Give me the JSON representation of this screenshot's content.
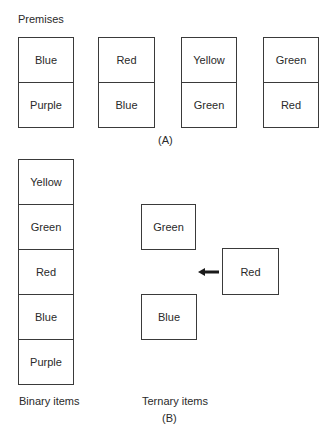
{
  "section_a": {
    "title": "Premises",
    "caption": "(A)",
    "premises": [
      {
        "top": "Blue",
        "bottom": "Purple"
      },
      {
        "top": "Red",
        "bottom": "Blue"
      },
      {
        "top": "Yellow",
        "bottom": "Green"
      },
      {
        "top": "Green",
        "bottom": "Red"
      }
    ]
  },
  "section_b": {
    "caption": "(B)",
    "binary": {
      "label": "Binary items",
      "items": [
        "Yellow",
        "Green",
        "Red",
        "Blue",
        "Purple"
      ]
    },
    "ternary": {
      "label": "Ternary items",
      "top": "Green",
      "middle": "Red",
      "bottom": "Blue",
      "arrow_icon": "left-arrow"
    }
  }
}
